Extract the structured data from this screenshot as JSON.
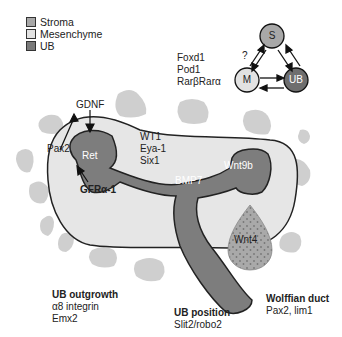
{
  "legend": {
    "items": [
      {
        "label": "Stroma",
        "color": "#a8a8a8"
      },
      {
        "label": "Mesenchyme",
        "color": "#e2e2e2"
      },
      {
        "label": "UB",
        "color": "#7a7a7a"
      }
    ]
  },
  "interaction_diagram": {
    "nodes": [
      {
        "id": "S",
        "label": "S",
        "color": "#a8a8a8"
      },
      {
        "id": "M",
        "label": "M",
        "color": "#e2e2e2"
      },
      {
        "id": "UB",
        "label": "UB",
        "color": "#6e6e6e"
      }
    ],
    "question_mark": "?",
    "stroma_genes": [
      "Foxd1",
      "Pod1",
      "RarβRarα"
    ]
  },
  "labels": {
    "gdnf": "GDNF",
    "pax2": "Pax2",
    "ret": "Ret",
    "gfra1": "GFRα-1",
    "wt1": "WT1",
    "eya1": "Eya-1",
    "six1": "Six1",
    "bmp7": "BMP7",
    "wnt9b": "Wnt9b",
    "wnt4": "Wnt4"
  },
  "annotations": {
    "ub_outgrowth": {
      "title": "UB outgrowth",
      "lines": [
        "α8 integrin",
        "Emx2"
      ]
    },
    "ub_position": {
      "title": "UB position",
      "lines": [
        "Slit2/robo2"
      ]
    },
    "wolffian_duct": {
      "title": "Wolffian duct",
      "lines": [
        "Pax2, lim1"
      ]
    }
  },
  "colors": {
    "stroma": "#c8c8c8",
    "mesenchyme": "#e6e6e6",
    "ub": "#7d7d7d",
    "outline": "#222222"
  }
}
